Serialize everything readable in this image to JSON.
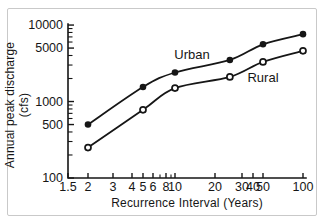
{
  "figure": {
    "background": "#ffffff",
    "border_color": "#c9c9c9",
    "line_color": "#161616"
  },
  "chart_data": {
    "type": "line",
    "title": "",
    "xlabel": "Recurrence Interval (Years)",
    "ylabel": "Annual peak discharge (cfs)",
    "x_scale": "log",
    "y_scale": "log",
    "xlim": [
      1.5,
      100
    ],
    "ylim": [
      100,
      10000
    ],
    "grid": false,
    "x_ticks": [
      1.5,
      2,
      3,
      4,
      5,
      6,
      8,
      10,
      20,
      30,
      40,
      50,
      100
    ],
    "x_tick_labels": [
      "1.5",
      "2",
      "3",
      "4",
      "5",
      "6",
      "8",
      "10",
      "20",
      "30",
      "40",
      "50",
      "100"
    ],
    "x_minor_ticks": [
      7,
      9
    ],
    "y_ticks": [
      100,
      500,
      1000,
      5000,
      10000
    ],
    "y_tick_labels": [
      "100",
      "500",
      "1000",
      "5000",
      "10000"
    ],
    "y_minor_ticks": [
      200,
      300,
      400,
      600,
      700,
      800,
      900,
      2000,
      3000,
      4000,
      6000,
      7000,
      8000,
      9000
    ],
    "legend_position": "inline-labels",
    "series": [
      {
        "name": "Urban",
        "label_text": "Urban",
        "marker": "filled-circle",
        "color": "#161616",
        "x": [
          2,
          5,
          10,
          25,
          50,
          100
        ],
        "values": [
          500,
          1550,
          2400,
          3500,
          5600,
          7600
        ]
      },
      {
        "name": "Rural",
        "label_text": "Rural",
        "marker": "open-circle",
        "color": "#161616",
        "x": [
          2,
          5,
          10,
          25,
          50,
          100
        ],
        "values": [
          250,
          780,
          1500,
          2100,
          3300,
          4600
        ]
      }
    ]
  }
}
